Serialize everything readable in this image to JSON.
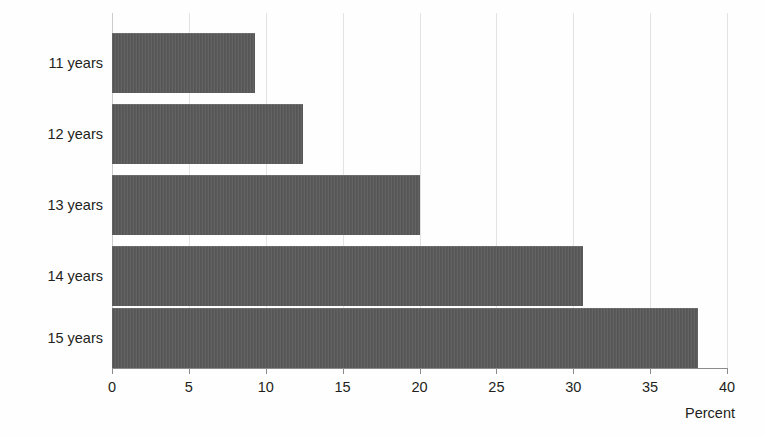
{
  "chart_data": {
    "type": "bar",
    "orientation": "horizontal",
    "title": "",
    "subtitle": "",
    "xlabel": "Percent",
    "ylabel": "",
    "categories": [
      "11 years",
      "12 years",
      "13 years",
      "14 years",
      "15 years"
    ],
    "values": [
      9.3,
      12.4,
      20.0,
      30.6,
      38.1
    ],
    "series": [
      {
        "name": "Percent",
        "values": [
          9.3,
          12.4,
          20.0,
          30.6,
          38.1
        ]
      }
    ],
    "xlim": [
      0,
      40
    ],
    "xticks": [
      0,
      5,
      10,
      15,
      20,
      25,
      30,
      35,
      40
    ],
    "xtick_labels": [
      "0",
      "5",
      "10",
      "15",
      "20",
      "25",
      "30",
      "35",
      "40"
    ],
    "grid": true,
    "grid_axis": "x",
    "legend": false,
    "legend_position": "none",
    "annotations": [],
    "colors": {
      "bar_fill": "#5a5a5a",
      "gridline": "#e3e3e3",
      "axis_line": "#8c8c8c",
      "text": "#231f20",
      "background": "#ffffff"
    }
  }
}
